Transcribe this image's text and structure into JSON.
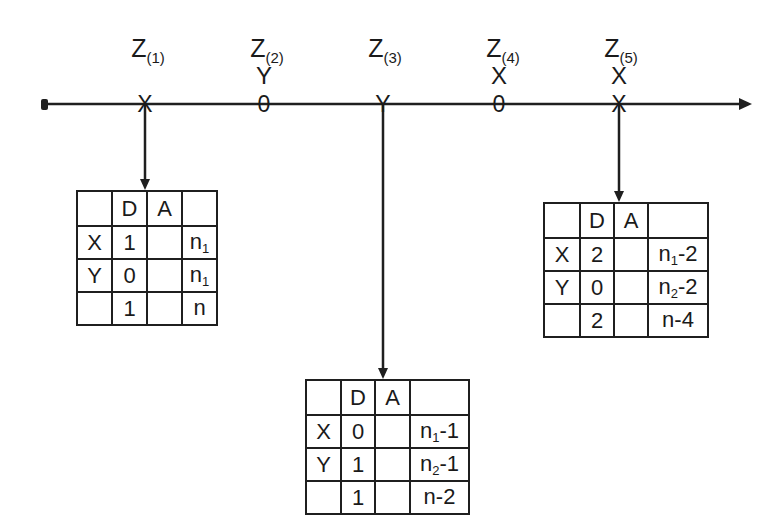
{
  "axis": {
    "positions": [
      {
        "label": "Z",
        "index": "(1)",
        "above": "",
        "marker": "X",
        "marker_name": "x-mark"
      },
      {
        "label": "Z",
        "index": "(2)",
        "above": "Y",
        "marker": "0",
        "marker_name": "zero-mark"
      },
      {
        "label": "Z",
        "index": "(3)",
        "above": "",
        "marker": "Y",
        "marker_name": "y-mark"
      },
      {
        "label": "Z",
        "index": "(4)",
        "above": "X",
        "marker": "0",
        "marker_name": "zero-mark"
      },
      {
        "label": "Z",
        "index": "(5)",
        "above": "X",
        "marker": "X",
        "marker_name": "x-mark"
      }
    ]
  },
  "tables": [
    {
      "header": [
        "",
        "D",
        "A",
        ""
      ],
      "rows": [
        {
          "label": "X",
          "D": "1",
          "A": "",
          "n_base": "n",
          "n_sub": "1",
          "n_suffix": ""
        },
        {
          "label": "Y",
          "D": "0",
          "A": "",
          "n_base": "n",
          "n_sub": "1",
          "n_suffix": ""
        },
        {
          "label": "",
          "D": "1",
          "A": "",
          "n_base": "n",
          "n_sub": "",
          "n_suffix": ""
        }
      ]
    },
    {
      "header": [
        "",
        "D",
        "A",
        ""
      ],
      "rows": [
        {
          "label": "X",
          "D": "0",
          "A": "",
          "n_base": "n",
          "n_sub": "1",
          "n_suffix": "-1"
        },
        {
          "label": "Y",
          "D": "1",
          "A": "",
          "n_base": "n",
          "n_sub": "2",
          "n_suffix": "-1"
        },
        {
          "label": "",
          "D": "1",
          "A": "",
          "n_base": "n",
          "n_sub": "",
          "n_suffix": "-2"
        }
      ]
    },
    {
      "header": [
        "",
        "D",
        "A",
        ""
      ],
      "rows": [
        {
          "label": "X",
          "D": "2",
          "A": "",
          "n_base": "n",
          "n_sub": "1",
          "n_suffix": "-2"
        },
        {
          "label": "Y",
          "D": "0",
          "A": "",
          "n_base": "n",
          "n_sub": "2",
          "n_suffix": "-2"
        },
        {
          "label": "",
          "D": "2",
          "A": "",
          "n_base": "n",
          "n_sub": "",
          "n_suffix": "-4"
        }
      ]
    }
  ]
}
